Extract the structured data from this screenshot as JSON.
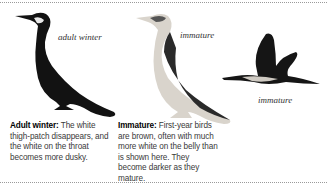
{
  "figure": {
    "birds": [
      {
        "id": "adult-winter",
        "label": "adult winter"
      },
      {
        "id": "immature-standing",
        "label": "immature"
      },
      {
        "id": "immature-flying",
        "label": "immature"
      }
    ],
    "captions": [
      {
        "heading": "Adult winter:",
        "text": " The white thigh-patch disappears, and the white on the throat becomes more dusky."
      },
      {
        "heading": "Immature:",
        "text": " First-year birds are brown, often with much more white on the belly than is shown here. They become darker as they mature."
      }
    ]
  }
}
